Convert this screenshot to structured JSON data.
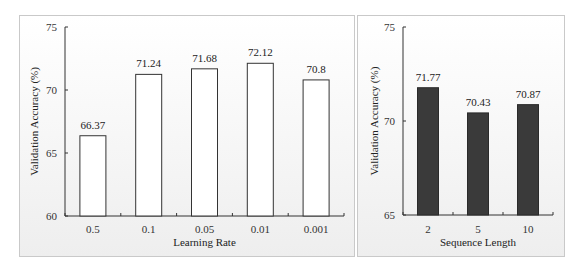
{
  "chart_data": [
    {
      "type": "bar",
      "title": "",
      "xlabel": "Learning Rate",
      "ylabel": "Validation Accuracy (%)",
      "categories": [
        "0.5",
        "0.1",
        "0.05",
        "0.01",
        "0.001"
      ],
      "values": [
        66.37,
        71.24,
        71.68,
        72.12,
        70.8
      ],
      "value_labels": [
        "66.37",
        "71.24",
        "71.68",
        "72.12",
        "70.8"
      ],
      "ylim": [
        60,
        75
      ],
      "yticks": [
        "60",
        "65",
        "70",
        "75"
      ],
      "grid": false,
      "legend": null,
      "bar_color": "#ffffff",
      "bar_edge_color": "#333333"
    },
    {
      "type": "bar",
      "title": "",
      "xlabel": "Sequence Length",
      "ylabel": "Validation Accuracy (%)",
      "categories": [
        "2",
        "5",
        "10"
      ],
      "values": [
        71.77,
        70.43,
        70.87
      ],
      "value_labels": [
        "71.77",
        "70.43",
        "70.87"
      ],
      "ylim": [
        65,
        75
      ],
      "yticks": [
        "65",
        "70",
        "75"
      ],
      "grid": false,
      "legend": null,
      "bar_color": "#3a3a3a",
      "bar_edge_color": "#2a2a2a"
    }
  ]
}
